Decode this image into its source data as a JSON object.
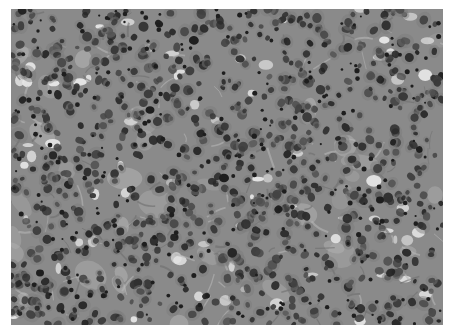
{
  "image": {
    "description": "Grayscale histology micrograph of densely cellular tissue with numerous dark, round to oval nuclei set in a lighter gray stroma, scattered pale clear spaces",
    "frame": {
      "x": 11,
      "y": 9,
      "width": 432,
      "height": 316
    },
    "colors": {
      "background": "#ffffff",
      "stroma": "#8a8a8a",
      "stroma_light": "#b5b5b5",
      "clear_space": "#e6e6e6",
      "cytoplasm": "#7a7a7a",
      "nucleus": "#3a3a3a",
      "nucleus_dark": "#1e1e1e"
    },
    "texture": {
      "seed": 7,
      "cell_count": 900,
      "clear_space_count": 70,
      "fiber_count": 140,
      "dark_speck_count": 260
    }
  }
}
